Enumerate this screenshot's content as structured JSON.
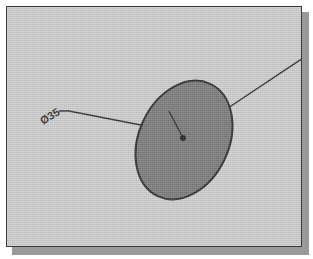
{
  "drawing": {
    "title": "Technical Drawing - Circular Feature",
    "type": "cad-dimension-sketch",
    "canvas": {
      "width": 313,
      "height": 259,
      "background_color": "#ffffff",
      "paper_color": "#c8c8c8",
      "border_color": "#3a3a3a",
      "shadow_color": "#9a9a9a",
      "frame": {
        "x": 6,
        "y": 6,
        "width": 296,
        "height": 241
      }
    },
    "shapes": {
      "ellipse": {
        "name": "circular-feature",
        "center_x": 177,
        "center_y": 133,
        "radius_x": 45,
        "radius_y": 62,
        "rotation_deg": 25,
        "fill_color": "#6e6e6e",
        "stroke_color": "#1d1d1d",
        "stroke_width": 2
      },
      "center_point": {
        "name": "center-mark",
        "x": 176,
        "y": 131,
        "radius": 3,
        "color": "#111111"
      },
      "radius_line": {
        "name": "radius-line",
        "x1": 176,
        "y1": 131,
        "x2": 162,
        "y2": 104,
        "color": "#1d1d1d",
        "width": 1.4
      },
      "leader_left": {
        "name": "diameter-leader-left",
        "points": "52,104 62,104 139,119",
        "color": "#1d1d1d",
        "width": 1.4
      },
      "leader_right": {
        "name": "leader-line-right",
        "x1": 176,
        "y1": 131,
        "x2": 296,
        "y2": 51,
        "color": "#1d1d1d",
        "width": 1.4
      }
    },
    "annotations": {
      "diameter_label": {
        "name": "diameter-dimension-label",
        "text": "Ø35",
        "x": 36,
        "y": 118,
        "rotation_deg": -32,
        "color": "#1d1d1d",
        "font_size": 11
      }
    }
  }
}
